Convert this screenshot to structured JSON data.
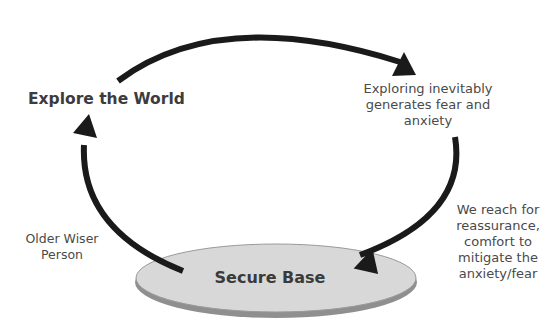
{
  "diagram": {
    "type": "cycle",
    "nodes": {
      "explore": "Explore the World",
      "fear": "Exploring inevitably generates fear and anxiety",
      "reach": "We reach for reassurance, comfort to mitigate the anxiety/fear",
      "secure_base": "Secure Base",
      "wiser": "Older Wiser Person"
    },
    "colors": {
      "arrow": "#1a1a1a",
      "base_fill": "#d6d6d6",
      "base_edge": "#8a8a8a",
      "text": "#3a3a3a"
    }
  }
}
